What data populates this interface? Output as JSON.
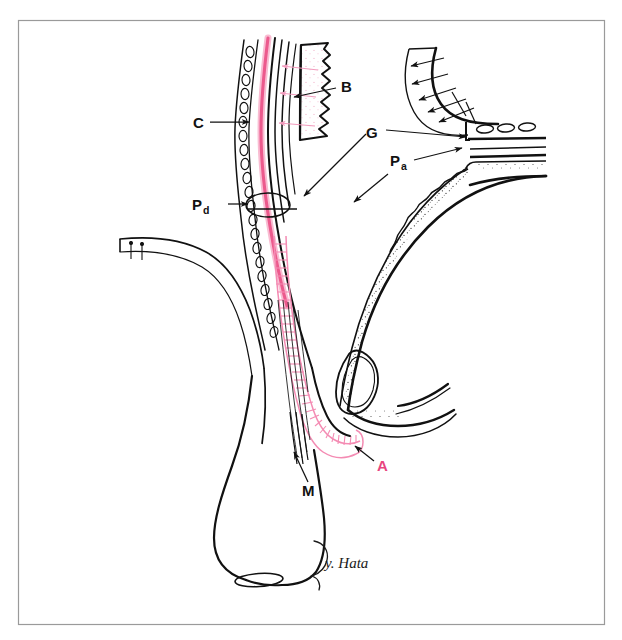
{
  "figure": {
    "type": "anatomical-line-drawing",
    "title": "",
    "background_color": "#ffffff",
    "frame": {
      "name": "image-border",
      "color": "#9a9a9a",
      "x": 18,
      "y": 20,
      "width": 587,
      "height": 605
    },
    "ink_color": "#111111",
    "accent_color": "#e8457f",
    "accent_light": "#f7a9c4",
    "signature": "y. Hata"
  },
  "labels": [
    {
      "id": "B",
      "text": "B",
      "sub": "",
      "color": "#121212",
      "x": 345,
      "y": 92,
      "leader": {
        "from": [
          336,
          88
        ],
        "to": [
          292,
          97
        ],
        "arrow": true
      }
    },
    {
      "id": "C",
      "text": "C",
      "sub": "",
      "color": "#121212",
      "x": 196,
      "y": 127,
      "leader": {
        "from": [
          208,
          122
        ],
        "to": [
          251,
          122
        ],
        "arrow": true
      }
    },
    {
      "id": "G",
      "text": "G",
      "sub": "",
      "color": "#121212",
      "x": 370,
      "y": 137,
      "leader": {
        "from": [
          366,
          133
        ],
        "to": [
          302,
          197
        ],
        "arrow": true
      },
      "leader2": {
        "from": [
          384,
          131
        ],
        "to": [
          468,
          137
        ],
        "arrow": true
      }
    },
    {
      "id": "Pd",
      "text": "P",
      "sub": "d",
      "color": "#121212",
      "x": 194,
      "y": 209,
      "leader": {
        "from": [
          226,
          205
        ],
        "to": [
          265,
          205
        ],
        "arrow": true
      }
    },
    {
      "id": "Pa",
      "text": "P",
      "sub": "a",
      "color": "#121212",
      "x": 392,
      "y": 165,
      "leader": {
        "from": [
          412,
          161
        ],
        "to": [
          462,
          148
        ],
        "arrow": true
      },
      "leader2": {
        "from": [
          388,
          172
        ],
        "to": [
          352,
          203
        ],
        "arrow": true
      }
    },
    {
      "id": "M",
      "text": "M",
      "sub": "",
      "color": "#121212",
      "x": 307,
      "y": 494,
      "leader": {
        "from": [
          308,
          482
        ],
        "to": [
          293,
          451
        ],
        "arrow": true
      }
    },
    {
      "id": "A",
      "text": "A",
      "sub": "",
      "color": "#e8457f",
      "x": 380,
      "y": 470,
      "leader": {
        "from": [
          374,
          461
        ],
        "to": [
          354,
          446
        ],
        "arrow": true
      }
    }
  ],
  "structures": [
    {
      "name": "b-wavy-plate",
      "label_ref": "B",
      "description": "stippled scalloped plate, upper center"
    },
    {
      "name": "c-bead-chain",
      "label_ref": "C",
      "description": "chain of small ovals along left wall"
    },
    {
      "name": "g-pink-band",
      "label_ref": "G",
      "description": "pink longitudinal band"
    },
    {
      "name": "pd-oval-node",
      "label_ref": "Pd",
      "description": "small oval node on the duct wall"
    },
    {
      "name": "pa-stippled-wall",
      "label_ref": "Pa",
      "description": "stippled wall of the right curved organ"
    },
    {
      "name": "m-muscle-fibers",
      "label_ref": "M",
      "description": "bundle of fine parallel fibers"
    },
    {
      "name": "a-pink-tube",
      "label_ref": "A",
      "description": "pink segmented tube running to lower right"
    },
    {
      "name": "left-branch-tube",
      "label_ref": "",
      "description": "cut tubular branch entering from the left"
    },
    {
      "name": "upper-right-hatched",
      "label_ref": "",
      "description": "curved hatched band, upper right"
    },
    {
      "name": "oval-triplet",
      "label_ref": "",
      "description": "three small ovals, upper right"
    },
    {
      "name": "bottom-bulb",
      "label_ref": "",
      "description": "pear-shaped bulb with small oval at base"
    }
  ]
}
